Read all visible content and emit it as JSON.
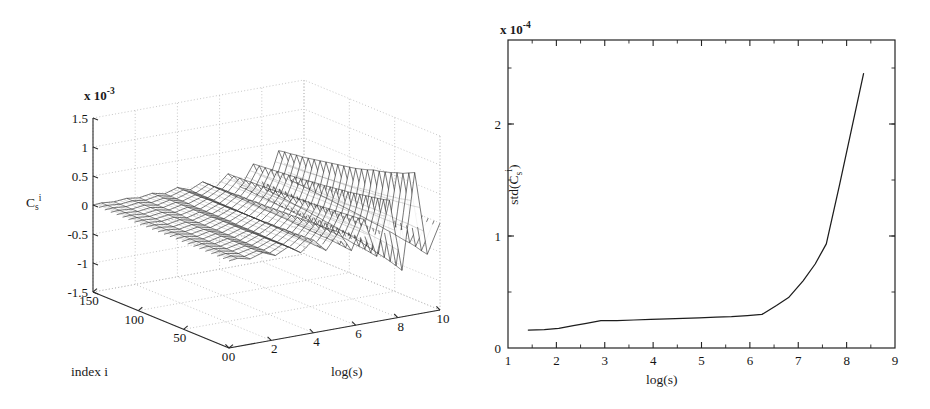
{
  "figure": {
    "panels": [
      "surface-plot",
      "line-plot"
    ]
  },
  "left_panel": {
    "name": "3d-surface-plot",
    "exponent_label": "x 10",
    "exponent_power": "-3",
    "z_axis": {
      "label_base": "C",
      "label_sub": "s",
      "label_sup": "i",
      "ticks": [
        "1.5",
        "1",
        "0.5",
        "0",
        "-0.5",
        "-1",
        "-1.5"
      ],
      "tick_values": [
        1.5,
        1,
        0.5,
        0,
        -0.5,
        -1,
        -1.5
      ],
      "range": [
        -1.5,
        1.5
      ],
      "scale": "1e-3"
    },
    "y_axis": {
      "title": "index i",
      "ticks": [
        "150",
        "100",
        "50",
        "0"
      ],
      "tick_values": [
        150,
        100,
        50,
        0
      ],
      "range": [
        0,
        150
      ]
    },
    "x_axis": {
      "title": "log(s)",
      "ticks": [
        "0",
        "2",
        "4",
        "6",
        "8",
        "10"
      ],
      "tick_values": [
        0,
        2,
        4,
        6,
        8,
        10
      ],
      "range": [
        0,
        10
      ]
    },
    "grid": "dotted"
  },
  "right_panel": {
    "name": "std-line-plot",
    "exponent_label": "x 10",
    "exponent_power": "-4",
    "y_axis": {
      "label_prefix": "std(C",
      "label_sub": "s",
      "label_sup": "i",
      "label_suffix": ")",
      "ticks": [
        "0",
        "1",
        "2"
      ],
      "tick_values": [
        0,
        1,
        2
      ],
      "range": [
        0,
        2.75
      ],
      "scale": "1e-4"
    },
    "x_axis": {
      "title": "log(s)",
      "ticks": [
        "1",
        "2",
        "3",
        "4",
        "5",
        "6",
        "7",
        "8",
        "9"
      ],
      "tick_values": [
        1,
        2,
        3,
        4,
        5,
        6,
        7,
        8,
        9
      ],
      "range": [
        1,
        9
      ]
    }
  },
  "chart_data": [
    {
      "type": "line",
      "panel": "left",
      "title": "",
      "xlabel": "log(s)",
      "ylabel": "index i",
      "zlabel": "C_s^i",
      "subtype": "3d-mesh-waterfall",
      "xlim": [
        0,
        10
      ],
      "ylim": [
        0,
        150
      ],
      "zlim": [
        -1.5,
        1.5
      ],
      "z_scale": 0.001,
      "grid": true,
      "legend": "none",
      "note": "Waterfall mesh surface of C_s^i versus log(s) and index i; amplitude of oscillation grows with log(s), largest spikes near log(s)=6-10",
      "n_rows": 24,
      "row_index_values": [
        0,
        6.5,
        13,
        19.5,
        26,
        32.6,
        39.1,
        45.6,
        52.1,
        58.7,
        65.2,
        71.7,
        78.2,
        84.8,
        91.3,
        97.8,
        104.3,
        110.9,
        117.4,
        123.9,
        130.4,
        137,
        143.5,
        150
      ],
      "x_samples": [
        0.4,
        1.0,
        1.6,
        2.2,
        2.8,
        3.4,
        4.0,
        4.6,
        5.2,
        5.8,
        6.4,
        7.0,
        7.6,
        8.2,
        8.8,
        9.4
      ],
      "series": [
        {
          "name": "row-0",
          "values": [
            0.02,
            -0.03,
            0.04,
            -0.05,
            0.06,
            -0.08,
            0.1,
            -0.12,
            0.16,
            -0.2,
            0.3,
            -0.38,
            0.55,
            -0.7,
            0.95,
            -0.5
          ]
        },
        {
          "name": "row-6",
          "values": [
            0.02,
            -0.03,
            0.03,
            -0.05,
            0.06,
            -0.07,
            0.09,
            -0.11,
            0.15,
            -0.19,
            0.28,
            -0.36,
            0.52,
            -0.66,
            0.9,
            -0.48
          ]
        },
        {
          "name": "row-13",
          "values": [
            0.02,
            -0.02,
            0.03,
            -0.04,
            0.05,
            -0.07,
            0.09,
            -0.11,
            0.14,
            -0.18,
            0.27,
            -0.34,
            0.5,
            -0.63,
            0.85,
            -0.45
          ]
        },
        {
          "name": "row-20",
          "values": [
            0.02,
            -0.02,
            0.03,
            -0.04,
            0.05,
            -0.06,
            0.08,
            -0.1,
            0.14,
            -0.17,
            0.26,
            -0.33,
            0.48,
            -0.6,
            0.82,
            -0.43
          ]
        },
        {
          "name": "row-26",
          "values": [
            0.02,
            -0.02,
            0.03,
            -0.04,
            0.05,
            -0.06,
            0.08,
            -0.1,
            0.13,
            -0.16,
            0.25,
            -0.32,
            0.46,
            -0.58,
            0.78,
            -0.42
          ]
        },
        {
          "name": "row-33",
          "values": [
            0.02,
            -0.02,
            0.03,
            -0.04,
            0.05,
            -0.06,
            0.08,
            -0.09,
            0.13,
            -0.16,
            0.24,
            -0.3,
            0.44,
            -0.55,
            0.75,
            -0.4
          ]
        },
        {
          "name": "row-39",
          "values": [
            0.02,
            -0.02,
            0.03,
            -0.04,
            0.05,
            -0.06,
            0.07,
            -0.09,
            0.12,
            -0.15,
            0.23,
            -0.29,
            0.42,
            -0.53,
            0.72,
            -0.38
          ]
        },
        {
          "name": "row-46",
          "values": [
            0.02,
            -0.02,
            0.03,
            -0.03,
            0.04,
            -0.05,
            0.07,
            -0.09,
            0.12,
            -0.15,
            0.22,
            -0.28,
            0.4,
            -0.5,
            0.7,
            -0.37
          ]
        },
        {
          "name": "row-52",
          "values": [
            0.02,
            -0.02,
            0.03,
            -0.03,
            0.04,
            -0.05,
            0.07,
            -0.08,
            0.11,
            -0.14,
            0.21,
            -0.27,
            0.39,
            -0.48,
            0.66,
            -0.35
          ]
        },
        {
          "name": "row-59",
          "values": [
            0.02,
            -0.02,
            0.03,
            -0.03,
            0.04,
            -0.05,
            0.06,
            -0.08,
            0.11,
            -0.14,
            0.2,
            -0.26,
            0.37,
            -0.46,
            0.63,
            -0.34
          ]
        },
        {
          "name": "row-65",
          "values": [
            0.02,
            -0.02,
            0.02,
            -0.03,
            0.04,
            -0.05,
            0.06,
            -0.08,
            0.1,
            -0.13,
            0.2,
            -0.25,
            0.36,
            -0.45,
            0.6,
            -0.33
          ]
        },
        {
          "name": "row-72",
          "values": [
            0.01,
            -0.02,
            0.02,
            -0.03,
            0.04,
            -0.05,
            0.06,
            -0.07,
            0.1,
            -0.12,
            0.19,
            -0.24,
            0.34,
            -0.43,
            0.58,
            -0.31
          ]
        },
        {
          "name": "row-78",
          "values": [
            0.01,
            -0.02,
            0.02,
            -0.03,
            0.04,
            -0.04,
            0.06,
            -0.07,
            0.09,
            -0.12,
            0.18,
            -0.23,
            0.33,
            -0.41,
            0.56,
            -0.3
          ]
        },
        {
          "name": "row-85",
          "values": [
            0.01,
            -0.02,
            0.02,
            -0.03,
            0.03,
            -0.04,
            0.06,
            -0.07,
            0.09,
            -0.11,
            0.17,
            -0.22,
            0.32,
            -0.4,
            0.54,
            -0.29
          ]
        },
        {
          "name": "row-91",
          "values": [
            0.01,
            -0.02,
            0.02,
            -0.03,
            0.03,
            -0.04,
            0.05,
            -0.07,
            0.09,
            -0.11,
            0.17,
            -0.21,
            0.3,
            -0.38,
            0.52,
            -0.28
          ]
        },
        {
          "name": "row-98",
          "values": [
            0.01,
            -0.01,
            0.02,
            -0.03,
            0.03,
            -0.04,
            0.05,
            -0.06,
            0.08,
            -0.11,
            0.16,
            -0.2,
            0.29,
            -0.37,
            0.5,
            -0.27
          ]
        },
        {
          "name": "row-104",
          "values": [
            0.01,
            -0.01,
            0.02,
            -0.02,
            0.03,
            -0.04,
            0.05,
            -0.06,
            0.08,
            -0.1,
            0.15,
            -0.2,
            0.28,
            -0.35,
            0.48,
            -0.26
          ]
        },
        {
          "name": "row-111",
          "values": [
            0.01,
            -0.01,
            0.02,
            -0.02,
            0.03,
            -0.04,
            0.05,
            -0.06,
            0.08,
            -0.1,
            0.15,
            -0.19,
            0.27,
            -0.34,
            0.46,
            -0.25
          ]
        },
        {
          "name": "row-117",
          "values": [
            0.01,
            -0.01,
            0.02,
            -0.02,
            0.03,
            -0.04,
            0.05,
            -0.06,
            0.07,
            -0.09,
            0.14,
            -0.18,
            0.26,
            -0.33,
            0.44,
            -0.24
          ]
        },
        {
          "name": "row-124",
          "values": [
            0.01,
            -0.01,
            0.02,
            -0.02,
            0.03,
            -0.03,
            0.04,
            -0.05,
            0.07,
            -0.09,
            0.14,
            -0.17,
            0.25,
            -0.31,
            0.42,
            -0.23
          ]
        },
        {
          "name": "row-130",
          "values": [
            0.01,
            -0.01,
            0.02,
            -0.02,
            0.03,
            -0.03,
            0.04,
            -0.05,
            0.07,
            -0.09,
            0.13,
            -0.17,
            0.24,
            -0.3,
            0.41,
            -0.22
          ]
        },
        {
          "name": "row-137",
          "values": [
            0.01,
            -0.01,
            0.02,
            -0.02,
            0.02,
            -0.03,
            0.04,
            -0.05,
            0.06,
            -0.08,
            0.13,
            -0.16,
            0.23,
            -0.29,
            0.39,
            -0.21
          ]
        },
        {
          "name": "row-143",
          "values": [
            0.01,
            -0.01,
            0.01,
            -0.02,
            0.02,
            -0.03,
            0.04,
            -0.05,
            0.06,
            -0.08,
            0.12,
            -0.15,
            0.22,
            -0.28,
            0.38,
            -0.2
          ]
        },
        {
          "name": "row-150",
          "values": [
            0.01,
            -0.01,
            0.01,
            -0.02,
            0.02,
            -0.03,
            0.04,
            -0.04,
            0.06,
            -0.08,
            0.12,
            -0.15,
            0.21,
            -0.27,
            0.36,
            -0.2
          ]
        }
      ]
    },
    {
      "type": "line",
      "panel": "right",
      "title": "",
      "xlabel": "log(s)",
      "ylabel": "std(C_s^i)",
      "y_scale": 0.0001,
      "xlim": [
        1,
        9
      ],
      "ylim": [
        0,
        2.75
      ],
      "grid": false,
      "legend": "none",
      "x": [
        1.42,
        1.75,
        2.05,
        2.35,
        2.62,
        2.92,
        3.25,
        3.6,
        3.95,
        4.3,
        4.62,
        4.95,
        5.3,
        5.62,
        5.95,
        6.25,
        6.55,
        6.8,
        7.1,
        7.35,
        7.58,
        7.85,
        8.1,
        8.35
      ],
      "values": [
        0.16,
        0.165,
        0.175,
        0.2,
        0.22,
        0.245,
        0.245,
        0.25,
        0.255,
        0.26,
        0.265,
        0.27,
        0.275,
        0.28,
        0.29,
        0.3,
        0.38,
        0.45,
        0.6,
        0.75,
        0.93,
        1.45,
        1.95,
        2.45
      ]
    }
  ]
}
